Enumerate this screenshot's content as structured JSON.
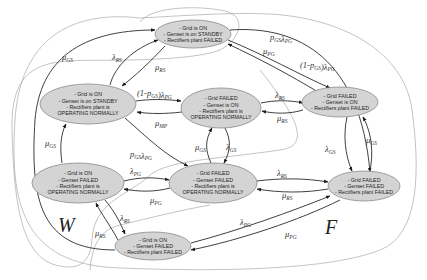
{
  "states": [
    {
      "id": "S1",
      "lines": [
        "- Grid is ON",
        "- Genset is on STANDBY",
        "- Rectifiers plant FAILED"
      ]
    },
    {
      "id": "S2",
      "lines": [
        "- Grid is ON",
        "- Genset is on STANDBY",
        "- Rectifiers plant is",
        "OPERATING NORMALLY"
      ]
    },
    {
      "id": "S3",
      "lines": [
        "- Grid FAILED",
        "- Genset is ON",
        "- Rectifiers plant is",
        "OPERATING NORMALLY"
      ]
    },
    {
      "id": "S4",
      "lines": [
        "- Grid FAILED",
        "- Genset is ON",
        "- Rectifiers plant FAILED"
      ]
    },
    {
      "id": "S5",
      "lines": [
        "- Grid is ON",
        "- Genset FAILED",
        "- Rectifiers plant is",
        "OPERATING NORMALLY"
      ]
    },
    {
      "id": "S6",
      "lines": [
        "- Grid FAILED",
        "- Genset FAILED",
        "- Rectifiers plant is",
        "OPERATING NORMALLY"
      ]
    },
    {
      "id": "S7",
      "lines": [
        "- Grid FAILED",
        "- Genset FAILED",
        "- Rectifiers plant FAILED"
      ]
    },
    {
      "id": "S8",
      "lines": [
        "- Grid is ON",
        "- Genset FAILED",
        "- Rectifiers plant FAILED"
      ]
    }
  ],
  "transitions": [
    {
      "from": "S2",
      "to": "S1",
      "rate": {
        "base": "λ",
        "sub": "RS"
      }
    },
    {
      "from": "S1",
      "to": "S2",
      "rate": {
        "base": "μ",
        "sub": "RS"
      }
    },
    {
      "from": "S1",
      "to": "S7",
      "rate": {
        "prefix": "",
        "base": "p",
        "sub": "GS",
        "mid": "λ",
        "sub2": "PG"
      }
    },
    {
      "from": "S1",
      "to": "S4",
      "rate": {
        "prefix": "(1-",
        "base": "p",
        "sub": "GS",
        "mid": ")λ",
        "sub2": "PG"
      }
    },
    {
      "from": "S4",
      "to": "S1",
      "rate": {
        "base": "μ",
        "sub": "PG"
      }
    },
    {
      "from": "S2",
      "to": "S3",
      "rate": {
        "prefix": "(1-",
        "base": "p",
        "sub": "GS",
        "mid": ")λ",
        "sub2": "PG"
      }
    },
    {
      "from": "S3",
      "to": "S2",
      "rate": {
        "base": "μ",
        "sub": "MP"
      }
    },
    {
      "from": "S2",
      "to": "S6",
      "rate": {
        "prefix": "",
        "base": "p",
        "sub": "GS",
        "mid": "λ",
        "sub2": "PG"
      }
    },
    {
      "from": "S3",
      "to": "S4",
      "rate": {
        "base": "λ",
        "sub": "RS"
      }
    },
    {
      "from": "S4",
      "to": "S3",
      "rate": {
        "base": "μ",
        "sub": "RS"
      }
    },
    {
      "from": "S6",
      "to": "S3",
      "rate": {
        "base": "μ",
        "sub": "GS"
      }
    },
    {
      "from": "S3",
      "to": "S6",
      "rate": {
        "base": "λ",
        "sub": "GS"
      }
    },
    {
      "from": "S4",
      "to": "S7",
      "rate": {
        "base": "λ",
        "sub": "GS"
      }
    },
    {
      "from": "S7",
      "to": "S4",
      "rate": {
        "base": "μ",
        "sub": "GS"
      }
    },
    {
      "from": "S5",
      "to": "S2",
      "rate": {
        "base": "μ",
        "sub": "GS"
      }
    },
    {
      "from": "S8",
      "to": "S1",
      "rate": {
        "base": "μ",
        "sub": "GS"
      }
    },
    {
      "from": "S5",
      "to": "S6",
      "rate": {
        "base": "λ",
        "sub": "PG"
      }
    },
    {
      "from": "S6",
      "to": "S5",
      "rate": {
        "base": "μ",
        "sub": "PG"
      }
    },
    {
      "from": "S6",
      "to": "S7",
      "rate": {
        "base": "λ",
        "sub": "RS"
      }
    },
    {
      "from": "S7",
      "to": "S6",
      "rate": {
        "base": "μ",
        "sub": "RS"
      }
    },
    {
      "from": "S5",
      "to": "S8",
      "rate": {
        "base": "λ",
        "sub": "RS"
      }
    },
    {
      "from": "S8",
      "to": "S5",
      "rate": {
        "base": "μ",
        "sub": "RS"
      }
    },
    {
      "from": "S8",
      "to": "S7",
      "rate": {
        "base": "λ",
        "sub": "PG"
      }
    },
    {
      "from": "S7",
      "to": "S8",
      "rate": {
        "base": "μ",
        "sub": "PG"
      }
    }
  ],
  "regions": [
    {
      "id": "W",
      "label": "W"
    },
    {
      "id": "F",
      "label": "F"
    }
  ],
  "colors": {
    "node_fill": "#d4d4d4",
    "node_stroke": "#8a8a8a",
    "edge": "#2a2a2a",
    "region_outline": "#9a9a9a"
  }
}
